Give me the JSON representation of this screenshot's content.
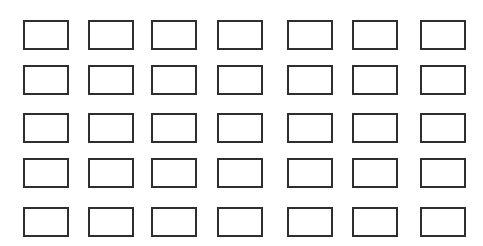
{
  "canvas": {
    "width": 483,
    "height": 246,
    "background": "#ffffff"
  },
  "grid": {
    "rows": 5,
    "columns": 7,
    "box_width": 46,
    "box_height": 30,
    "border_color": "#2e2e2e",
    "border_width": 2,
    "column_x": [
      23,
      88,
      151,
      217,
      287,
      352,
      420
    ],
    "row_y": [
      20,
      65,
      113,
      158,
      207
    ]
  }
}
